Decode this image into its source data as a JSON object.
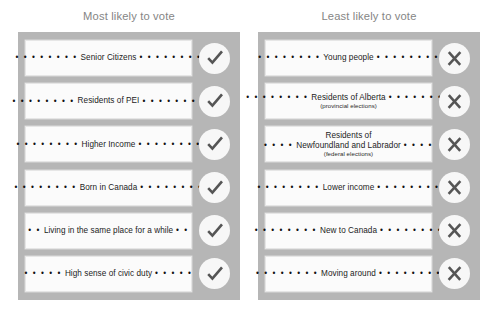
{
  "colors": {
    "panel_bg": "#b6b6b6",
    "card_bg": "#fbfbfb",
    "title_text": "#858585",
    "badge_bg": "#f7f7f7",
    "mark": "#555555",
    "page_bg": "#ffffff"
  },
  "columns": [
    {
      "title": "Most likely to vote",
      "icon": "check-icon",
      "rows": [
        {
          "leading_dots": "• • • • • • • •",
          "label": "Senior Citizens",
          "trailing_dots": "• • • • • • • •",
          "sublabel": "",
          "dot_layout": "inline"
        },
        {
          "leading_dots": "• • • • • • • •",
          "label": "Residents of PEI",
          "trailing_dots": "• • • • • • • •",
          "sublabel": "",
          "dot_layout": "inline"
        },
        {
          "leading_dots": "• • • • • • • •",
          "label": "Higher Income",
          "trailing_dots": "• • • • • • • •",
          "sublabel": "",
          "dot_layout": "inline"
        },
        {
          "leading_dots": "• • • • • • • •",
          "label": "Born in Canada",
          "trailing_dots": "• • • • • • • •",
          "sublabel": "",
          "dot_layout": "inline"
        },
        {
          "leading_dots": "• •",
          "label": "Living in the same place for a while",
          "trailing_dots": "• •",
          "sublabel": "",
          "dot_layout": "inline"
        },
        {
          "leading_dots": "• • • • •",
          "label": "High sense of civic duty",
          "trailing_dots": "• • • • •",
          "sublabel": "",
          "dot_layout": "inline"
        }
      ]
    },
    {
      "title": "Least likely to vote",
      "icon": "x-icon",
      "rows": [
        {
          "leading_dots": "• • • • • • • •",
          "label": "Young people",
          "trailing_dots": "• • • • • • • •",
          "sublabel": "",
          "dot_layout": "inline"
        },
        {
          "leading_dots": "• • • • • • • •",
          "label": "Residents of Alberta",
          "trailing_dots": "• • • • • • • •",
          "sublabel": "(provincial elections)",
          "dot_layout": "inline"
        },
        {
          "leading_dots": "• • • •",
          "label": "Newfoundland and Labrador",
          "trailing_dots": "• • • •",
          "sublabel": "(federal elections)",
          "toplabel": "Residents of",
          "dot_layout": "three-line"
        },
        {
          "leading_dots": "• • • • • • • •",
          "label": "Lower income",
          "trailing_dots": "• • • • • • • •",
          "sublabel": "",
          "dot_layout": "inline"
        },
        {
          "leading_dots": "• • • • • • • •",
          "label": "New to Canada",
          "trailing_dots": "• • • • • • • •",
          "sublabel": "",
          "dot_layout": "inline"
        },
        {
          "leading_dots": "• • • • • • • •",
          "label": "Moving around",
          "trailing_dots": "• • • • • • • •",
          "sublabel": "",
          "dot_layout": "inline"
        }
      ]
    }
  ]
}
